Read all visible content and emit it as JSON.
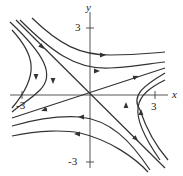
{
  "diagram": {
    "type": "phase-portrait",
    "axes": {
      "x_label": "x",
      "y_label": "y",
      "x_ticks": [
        "-3",
        "3"
      ],
      "y_ticks": [
        "3",
        "-3"
      ]
    },
    "colors": {
      "curve": "#333333",
      "axis": "#444444",
      "background": "#ffffff"
    }
  }
}
